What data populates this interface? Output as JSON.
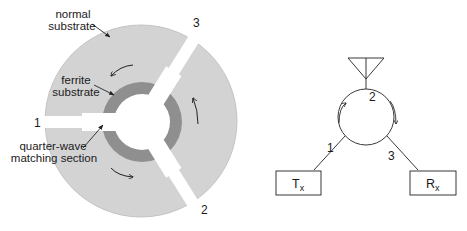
{
  "colors": {
    "normal_substrate": "#d3d3d3",
    "ferrite_substrate": "#8f8f8f",
    "conductor": "#ffffff",
    "line": "#222222"
  },
  "left_diagram": {
    "labels": {
      "normal_substrate_line1": "normal",
      "normal_substrate_line2": "substrate",
      "ferrite_substrate_line1": "ferrite",
      "ferrite_substrate_line2": "substrate",
      "quarter_wave_line1": "quarter-wave",
      "quarter_wave_line2": "matching section"
    },
    "ports": [
      "1",
      "2",
      "3"
    ]
  },
  "right_diagram": {
    "ports": [
      "1",
      "2",
      "3"
    ],
    "boxes": {
      "tx_main": "T",
      "tx_sub": "x",
      "rx_main": "R",
      "rx_sub": "x"
    }
  }
}
